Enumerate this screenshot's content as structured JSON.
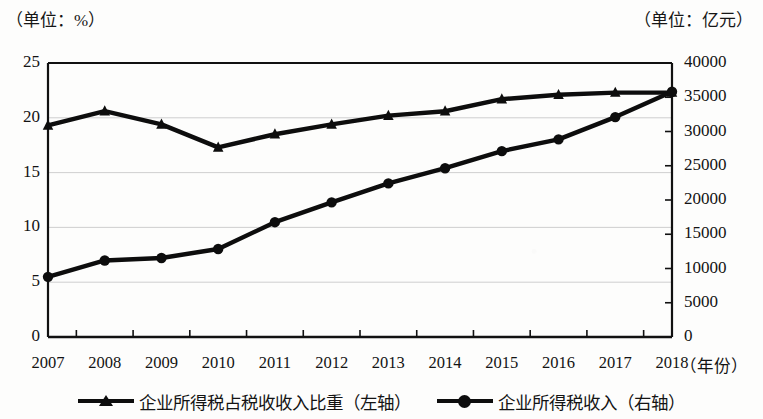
{
  "chart_data": {
    "type": "line",
    "title": "",
    "unit_label_left": "（单位：%）",
    "unit_label_right": "（单位：亿元）",
    "xlabel": "（年份）",
    "categories": [
      "2007",
      "2008",
      "2009",
      "2010",
      "2011",
      "2012",
      "2013",
      "2014",
      "2015",
      "2016",
      "2017",
      "2018"
    ],
    "grid": true,
    "legend_position": "bottom",
    "axes": {
      "left": {
        "label": "（单位：%）",
        "ticks": [
          "0",
          "5",
          "10",
          "15",
          "20",
          "25"
        ],
        "tick_values": [
          0,
          5,
          10,
          15,
          20,
          25
        ],
        "ylim": [
          0,
          25
        ]
      },
      "right": {
        "label": "（单位：亿元）",
        "ticks": [
          "0",
          "5000",
          "10000",
          "15000",
          "20000",
          "25000",
          "30000",
          "35000",
          "40000"
        ],
        "tick_values": [
          0,
          5000,
          10000,
          15000,
          20000,
          25000,
          30000,
          35000,
          40000
        ],
        "ylim": [
          0,
          40000
        ]
      }
    },
    "series": [
      {
        "name": "企业所得税占税收收入比重（左轴）",
        "axis": "left",
        "marker": "triangle",
        "color": "#0d0d0d",
        "values": [
          19.3,
          20.6,
          19.4,
          17.3,
          18.5,
          19.4,
          20.2,
          20.6,
          21.7,
          22.1,
          22.3,
          22.3
        ]
      },
      {
        "name": "企业所得税收入（右轴）",
        "axis": "right",
        "marker": "circle",
        "color": "#0d0d0d",
        "values": [
          8780,
          11175,
          11537,
          12844,
          16760,
          19654,
          22427,
          24642,
          27133,
          28851,
          32100,
          35800
        ]
      }
    ]
  },
  "legend": {
    "items": [
      {
        "label": "企业所得税占税收收入比重（左轴）",
        "marker": "triangle"
      },
      {
        "label": "企业所得税收入（右轴）",
        "marker": "circle"
      }
    ]
  }
}
